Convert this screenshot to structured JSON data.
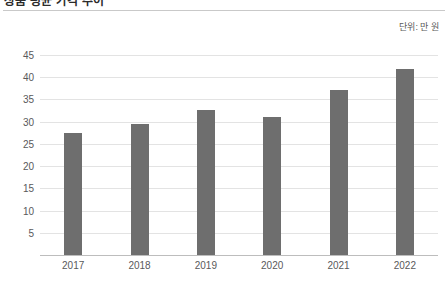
{
  "header": {
    "title_partial": "상품 평균 가격 추이",
    "unit_label": "단위: 만 원"
  },
  "chart_data": {
    "type": "bar",
    "title": "상품 평균 가격 추이",
    "xlabel": "",
    "ylabel": "",
    "unit": "단위: 만 원",
    "categories": [
      "2017",
      "2018",
      "2019",
      "2020",
      "2021",
      "2022"
    ],
    "values": [
      27.5,
      29.4,
      32.7,
      31.0,
      37.2,
      41.8
    ],
    "ylim": [
      0,
      47
    ],
    "yticks": [
      45,
      40,
      35,
      30,
      25,
      20,
      15,
      10,
      5
    ],
    "ytick_labels": [
      "45",
      "40",
      "35",
      "30",
      "25",
      "20",
      "15",
      "10",
      "5"
    ],
    "grid": true,
    "legend": false,
    "bar_color": "#6e6e6e",
    "gridline_color": "#e3e3e3",
    "axis_color": "#bdbdbd",
    "tick_text_color": "#59595b",
    "background": "#ffffff"
  }
}
